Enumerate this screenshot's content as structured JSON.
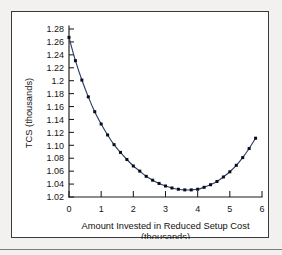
{
  "figure": {
    "background_color": "#f2f1ef",
    "plot_background_color": "#ffffff",
    "frame_color": "#3b3b3d"
  },
  "chart_data": {
    "type": "line",
    "title": "",
    "subtitle": "",
    "xlabel": "Amount Invested in Reduced Setup Cost",
    "xlabel_units": "(thousands)",
    "ylabel": "TCS (thousands)",
    "xlim": [
      0,
      6
    ],
    "ylim": [
      1.02,
      1.28
    ],
    "grid": false,
    "legend": false,
    "legend_position": "none",
    "curve_color": "#2a3f6b",
    "marker_color": "#0c0c16",
    "marker_shape": "square",
    "x_ticks": [
      0,
      1,
      2,
      3,
      4,
      5,
      6
    ],
    "x_tick_labels": [
      "0",
      "1",
      "2",
      "3",
      "4",
      "5",
      "6"
    ],
    "y_ticks": [
      1.02,
      1.04,
      1.06,
      1.08,
      1.1,
      1.12,
      1.14,
      1.16,
      1.18,
      1.2,
      1.22,
      1.24,
      1.26,
      1.28
    ],
    "y_tick_labels": [
      "1.02",
      "1.04",
      "1.06",
      "1.08",
      "1.10",
      "1.12",
      "1.14",
      "1.16",
      "1.18",
      "1.2",
      "1.22",
      "1.24",
      "1.26",
      "1.28"
    ],
    "series": [
      {
        "name": "TCS",
        "x": [
          0.0,
          0.2,
          0.4,
          0.6,
          0.8,
          1.0,
          1.2,
          1.4,
          1.6,
          1.8,
          2.0,
          2.2,
          2.4,
          2.6,
          2.8,
          3.0,
          3.2,
          3.4,
          3.6,
          3.8,
          4.0,
          4.2,
          4.4,
          4.6,
          4.8,
          5.0,
          5.2,
          5.4,
          5.6,
          5.8
        ],
        "y": [
          1.267,
          1.231,
          1.201,
          1.175,
          1.152,
          1.133,
          1.116,
          1.101,
          1.089,
          1.078,
          1.068,
          1.06,
          1.052,
          1.046,
          1.041,
          1.037,
          1.034,
          1.032,
          1.031,
          1.031,
          1.032,
          1.035,
          1.039,
          1.044,
          1.051,
          1.059,
          1.069,
          1.081,
          1.095,
          1.111
        ]
      }
    ],
    "minimum_point": {
      "x": 3.0,
      "y": 1.025
    },
    "start_point": {
      "x": 0.0,
      "y": 1.267
    },
    "end_point": {
      "x": 5.8,
      "y": 1.147
    }
  }
}
